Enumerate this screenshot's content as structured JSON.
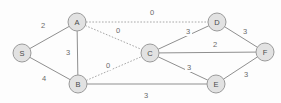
{
  "diagram": {
    "colors": {
      "background": "#fdfdfd",
      "node_fill": "#e2e2e2",
      "node_stroke": "#9a9a9a",
      "edge_solid": "#8f8f8f",
      "edge_dotted": "#a8a8a8",
      "node_text": "#4a4a4a",
      "label_text": "#6a6a6a"
    },
    "node_radius": 9,
    "nodes": [
      {
        "id": "S",
        "label": "S",
        "x": 22,
        "y": 53
      },
      {
        "id": "A",
        "label": "A",
        "x": 77,
        "y": 22
      },
      {
        "id": "B",
        "label": "B",
        "x": 78,
        "y": 84
      },
      {
        "id": "C",
        "label": "C",
        "x": 150,
        "y": 53
      },
      {
        "id": "D",
        "label": "D",
        "x": 217,
        "y": 22
      },
      {
        "id": "E",
        "label": "E",
        "x": 216,
        "y": 84
      },
      {
        "id": "F",
        "label": "F",
        "x": 265,
        "y": 52
      }
    ],
    "edges": [
      {
        "from": "S",
        "to": "A",
        "weight": "2",
        "style": "solid",
        "lx": 43,
        "ly": 25
      },
      {
        "from": "S",
        "to": "B",
        "weight": "4",
        "style": "solid",
        "lx": 44,
        "ly": 78
      },
      {
        "from": "A",
        "to": "B",
        "weight": "3",
        "style": "solid",
        "lx": 68,
        "ly": 52
      },
      {
        "from": "A",
        "to": "D",
        "weight": "0",
        "style": "dotted",
        "lx": 152,
        "ly": 12
      },
      {
        "from": "A",
        "to": "C",
        "weight": "0",
        "style": "dotted",
        "lx": 118,
        "ly": 30
      },
      {
        "from": "B",
        "to": "C",
        "weight": "0",
        "style": "dotted",
        "lx": 108,
        "ly": 65
      },
      {
        "from": "B",
        "to": "E",
        "weight": "3",
        "style": "solid",
        "lx": 146,
        "ly": 95
      },
      {
        "from": "C",
        "to": "D",
        "weight": "3",
        "style": "solid",
        "lx": 188,
        "ly": 31
      },
      {
        "from": "C",
        "to": "F",
        "weight": "2",
        "style": "solid",
        "lx": 215,
        "ly": 44
      },
      {
        "from": "C",
        "to": "E",
        "weight": "3",
        "style": "solid",
        "lx": 189,
        "ly": 67
      },
      {
        "from": "D",
        "to": "F",
        "weight": "3",
        "style": "solid",
        "lx": 245,
        "ly": 31
      },
      {
        "from": "E",
        "to": "F",
        "weight": "3",
        "style": "solid",
        "lx": 246,
        "ly": 74
      }
    ]
  }
}
